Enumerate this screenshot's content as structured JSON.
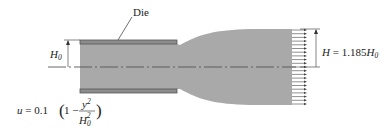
{
  "figure": {
    "type": "extrudate-swell-diagram",
    "colors": {
      "fluid": "#a9a9a9",
      "die_wall": "#8c8c8c",
      "die_wall_edge": "#555555",
      "centerline": "#555555",
      "arrows": "#444444",
      "text": "#222222"
    }
  },
  "labels": {
    "die": "Die",
    "inlet_height_symbol": "H",
    "inlet_height_subscript": "0",
    "outlet_height_symbol": "H",
    "outlet_relation": " = 1.185",
    "outlet_ref_symbol": "H",
    "outlet_ref_subscript": "0",
    "velocity_lhs": "u",
    "velocity_eq": " = 0.1",
    "velocity_one_minus": "1 −",
    "velocity_num_var": "y",
    "velocity_num_exp": "2",
    "velocity_den_var": "H",
    "velocity_den_sub": "0",
    "velocity_den_exp": "2"
  },
  "annotations": {
    "swell_ratio": 1.185,
    "inlet_velocity_profile": "u = 0.1(1 - y^2/H0^2)",
    "outlet_profile": "uniform (plug flow)",
    "outlet_arrow_count": 21
  }
}
